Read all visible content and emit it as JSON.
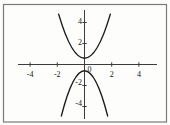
{
  "figure": {
    "background": "#fdfdfc",
    "frame_color": "#7a7a7a",
    "axis_color": "#3c3c3c",
    "curve_color": "#1c1c1c",
    "label_color": "#141414"
  },
  "chart_data": {
    "type": "line",
    "title": "",
    "xlabel": "",
    "ylabel": "",
    "xlim": [
      -5.2,
      5.4
    ],
    "ylim": [
      -5.6,
      5.2
    ],
    "grid": false,
    "legend": null,
    "origin_label": "0",
    "x_ticks": [
      {
        "value": -4,
        "label": "-4"
      },
      {
        "value": -2,
        "label": "-2"
      },
      {
        "value": 2,
        "label": "2"
      },
      {
        "value": 4,
        "label": "4"
      }
    ],
    "y_ticks": [
      {
        "value": 4,
        "label": "4"
      },
      {
        "value": 2,
        "label": "2"
      },
      {
        "value": -2,
        "label": "-2"
      },
      {
        "value": -4,
        "label": "-4"
      }
    ],
    "series": [
      {
        "name": "upper-branch",
        "points": [
          [
            -1.9,
            4.8
          ],
          [
            0,
            0.6
          ],
          [
            1.9,
            4.8
          ]
        ]
      },
      {
        "name": "lower-branch",
        "points": [
          [
            -1.7,
            -4.9
          ],
          [
            0,
            -0.6
          ],
          [
            1.7,
            -4.9
          ]
        ]
      }
    ]
  }
}
